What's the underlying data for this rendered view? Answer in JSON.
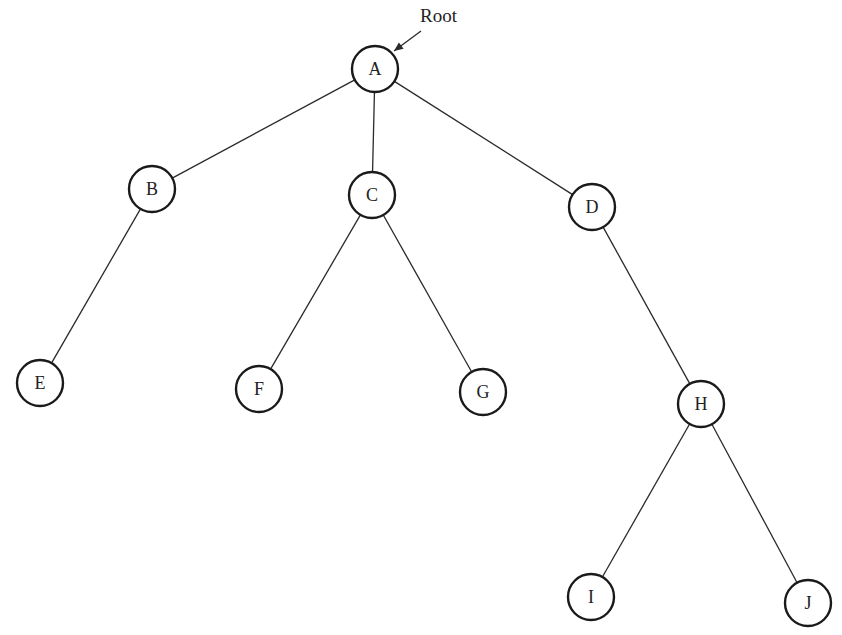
{
  "diagram": {
    "type": "tree",
    "title": "",
    "root_annotation": {
      "label": "Root",
      "points_to": "A",
      "label_pos": [
        420,
        22
      ],
      "arrow_from": [
        421,
        31
      ],
      "arrow_to": [
        394,
        51
      ]
    },
    "style": {
      "node_stroke": "#1a1a1a",
      "edge_stroke": "#2a2a2a",
      "background": "#ffffff",
      "node_radius": 23
    },
    "nodes": [
      {
        "id": "A",
        "label": "A",
        "x": 375,
        "y": 69
      },
      {
        "id": "B",
        "label": "B",
        "x": 152,
        "y": 189
      },
      {
        "id": "C",
        "label": "C",
        "x": 372,
        "y": 195
      },
      {
        "id": "D",
        "label": "D",
        "x": 592,
        "y": 207
      },
      {
        "id": "E",
        "label": "E",
        "x": 40,
        "y": 383
      },
      {
        "id": "F",
        "label": "F",
        "x": 259,
        "y": 389
      },
      {
        "id": "G",
        "label": "G",
        "x": 483,
        "y": 392
      },
      {
        "id": "H",
        "label": "H",
        "x": 701,
        "y": 404
      },
      {
        "id": "I",
        "label": "I",
        "x": 591,
        "y": 597
      },
      {
        "id": "J",
        "label": "J",
        "x": 808,
        "y": 603
      }
    ],
    "edges": [
      {
        "from": "A",
        "to": "B"
      },
      {
        "from": "A",
        "to": "C"
      },
      {
        "from": "A",
        "to": "D"
      },
      {
        "from": "B",
        "to": "E"
      },
      {
        "from": "C",
        "to": "F"
      },
      {
        "from": "C",
        "to": "G"
      },
      {
        "from": "D",
        "to": "H"
      },
      {
        "from": "H",
        "to": "I"
      },
      {
        "from": "H",
        "to": "J"
      }
    ]
  }
}
